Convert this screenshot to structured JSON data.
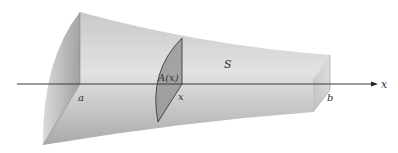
{
  "diagram": {
    "solid_label": "S",
    "cross_section_label": "A(x)",
    "axis_label": "x",
    "left_bound_label": "a",
    "right_bound_label": "b",
    "slice_position_label": "x"
  },
  "colors": {
    "background": "#ffffff",
    "solid_light": "#e6e6e6",
    "solid_dark": "#9a9a9a",
    "cross_section": "#8c8c8c",
    "axis": "#3a3a3a"
  }
}
